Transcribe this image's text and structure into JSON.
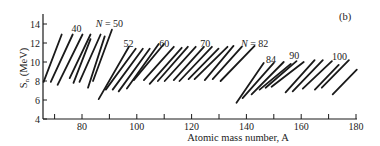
{
  "chart_data": {
    "type": "line",
    "panel_label": "(b)",
    "title": "",
    "xlabel": "Atomic mass number, A",
    "ylabel": "S_n (MeV)",
    "ylabel_main": "S",
    "ylabel_sub": "n",
    "ylabel_unit": " (MeV)",
    "xlim": [
      66,
      180
    ],
    "ylim": [
      4,
      15
    ],
    "grid": false,
    "legend": null,
    "x_ticks": [
      80,
      100,
      120,
      140,
      160,
      180
    ],
    "x_minor_ticks": [
      70,
      90,
      110,
      130,
      150,
      170
    ],
    "y_ticks": [
      4,
      6,
      8,
      10,
      12,
      14
    ],
    "annotations": [
      {
        "text": "40",
        "A": 78,
        "S": 13.2
      },
      {
        "text": "N = 50",
        "A": 90,
        "S": 13.7
      },
      {
        "text": "52",
        "A": 97,
        "S": 11.6
      },
      {
        "text": "60",
        "A": 110,
        "S": 11.6
      },
      {
        "text": "70",
        "A": 125,
        "S": 11.6
      },
      {
        "text": "N = 82",
        "A": 143,
        "S": 11.6
      },
      {
        "text": "84",
        "A": 149,
        "S": 9.9
      },
      {
        "text": "90",
        "A": 157.5,
        "S": 10.3
      },
      {
        "text": "100",
        "A": 174,
        "S": 10.2
      }
    ],
    "series": [
      {
        "name": "chain-1",
        "points": [
          [
            66.0,
            7.9
          ],
          [
            72.6,
            12.9
          ]
        ]
      },
      {
        "name": "chain-2",
        "points": [
          [
            68.6,
            7.9
          ],
          [
            76.6,
            12.9
          ]
        ]
      },
      {
        "name": "chain-3",
        "points": [
          [
            71.1,
            7.6
          ],
          [
            80.2,
            12.9
          ]
        ]
      },
      {
        "name": "chain-4",
        "points": [
          [
            75.5,
            8.3
          ],
          [
            83.1,
            12.9
          ]
        ]
      },
      {
        "name": "chain-5",
        "points": [
          [
            76.9,
            7.8
          ],
          [
            83.1,
            12.4
          ]
        ]
      },
      {
        "name": "chain-6",
        "points": [
          [
            79.1,
            7.9
          ],
          [
            86.8,
            12.9
          ]
        ]
      },
      {
        "name": "chain-7",
        "points": [
          [
            82.2,
            7.3
          ],
          [
            88.3,
            12.7
          ]
        ]
      },
      {
        "name": "chain-8",
        "points": [
          [
            84.0,
            8.0
          ],
          [
            90.9,
            13.4
          ]
        ]
      },
      {
        "name": "chain-9",
        "points": [
          [
            86.1,
            6.1
          ],
          [
            97.1,
            11.6
          ]
        ]
      },
      {
        "name": "chain-10",
        "points": [
          [
            88.7,
            7.1
          ],
          [
            99.6,
            11.4
          ]
        ]
      },
      {
        "name": "chain-11",
        "points": [
          [
            91.2,
            7.1
          ],
          [
            102.2,
            11.4
          ]
        ]
      },
      {
        "name": "chain-12",
        "points": [
          [
            93.4,
            6.9
          ],
          [
            104.7,
            11.4
          ]
        ]
      },
      {
        "name": "chain-13",
        "points": [
          [
            96.4,
            7.2
          ],
          [
            108.0,
            11.9
          ]
        ]
      },
      {
        "name": "chain-14",
        "points": [
          [
            98.9,
            8.1
          ],
          [
            109.9,
            11.9
          ]
        ]
      },
      {
        "name": "chain-15",
        "points": [
          [
            102.6,
            8.1
          ],
          [
            113.5,
            11.6
          ]
        ]
      },
      {
        "name": "chain-16",
        "points": [
          [
            104.7,
            7.7
          ],
          [
            116.4,
            11.5
          ]
        ]
      },
      {
        "name": "chain-17",
        "points": [
          [
            107.7,
            8.0
          ],
          [
            118.6,
            11.6
          ]
        ]
      },
      {
        "name": "chain-18",
        "points": [
          [
            110.2,
            8.0
          ],
          [
            121.5,
            11.6
          ]
        ]
      },
      {
        "name": "chain-19",
        "points": [
          [
            113.5,
            8.1
          ],
          [
            124.5,
            11.6
          ]
        ]
      },
      {
        "name": "chain-20",
        "points": [
          [
            115.6,
            8.0
          ],
          [
            127.4,
            11.6
          ]
        ]
      },
      {
        "name": "chain-21",
        "points": [
          [
            118.9,
            8.2
          ],
          [
            129.8,
            11.4
          ]
        ]
      },
      {
        "name": "chain-22",
        "points": [
          [
            121.1,
            8.2
          ],
          [
            133.1,
            11.6
          ]
        ]
      },
      {
        "name": "chain-23",
        "points": [
          [
            124.8,
            8.1
          ],
          [
            135.3,
            11.7
          ]
        ]
      },
      {
        "name": "chain-24",
        "points": [
          [
            127.7,
            8.2
          ],
          [
            138.3,
            11.6
          ]
        ]
      },
      {
        "name": "chain-25",
        "points": [
          [
            130.6,
            8.0
          ],
          [
            143.0,
            11.7
          ]
        ]
      },
      {
        "name": "chain-26",
        "points": [
          [
            136.4,
            5.7
          ],
          [
            146.3,
            9.9
          ]
        ]
      },
      {
        "name": "chain-27",
        "points": [
          [
            138.6,
            6.2
          ],
          [
            150.0,
            9.9
          ]
        ]
      },
      {
        "name": "chain-28",
        "points": [
          [
            141.9,
            6.6
          ],
          [
            153.6,
            10.0
          ]
        ]
      },
      {
        "name": "chain-29",
        "points": [
          [
            144.8,
            7.1
          ],
          [
            156.2,
            9.8
          ]
        ]
      },
      {
        "name": "chain-30",
        "points": [
          [
            147.0,
            7.3
          ],
          [
            158.3,
            10.1
          ]
        ]
      },
      {
        "name": "chain-31",
        "points": [
          [
            149.2,
            7.4
          ],
          [
            160.9,
            10.0
          ]
        ]
      },
      {
        "name": "chain-32",
        "points": [
          [
            154.3,
            6.8
          ],
          [
            164.9,
            10.2
          ]
        ]
      },
      {
        "name": "chain-33",
        "points": [
          [
            156.9,
            6.9
          ],
          [
            167.9,
            10.2
          ]
        ]
      },
      {
        "name": "chain-34",
        "points": [
          [
            160.6,
            7.2
          ],
          [
            171.2,
            10.1
          ]
        ]
      },
      {
        "name": "chain-35",
        "points": [
          [
            165.0,
            7.1
          ],
          [
            173.7,
            9.7
          ]
        ]
      },
      {
        "name": "chain-36",
        "points": [
          [
            167.5,
            7.3
          ],
          [
            177.4,
            10.2
          ]
        ]
      },
      {
        "name": "chain-37",
        "points": [
          [
            171.5,
            6.6
          ],
          [
            180.3,
            9.2
          ]
        ]
      }
    ]
  },
  "layout": {
    "ink": "#1a1a1a",
    "plot": {
      "x0": 43,
      "y_top": 14,
      "y_bottom": 119,
      "x_end": 357
    },
    "x_map": {
      "px_at_80": 82,
      "px_per_unit": 2.74
    },
    "y_map": {
      "px_at_4": 119,
      "px_per_unit": 9.5
    }
  }
}
